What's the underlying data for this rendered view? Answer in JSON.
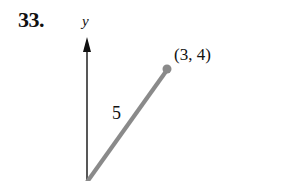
{
  "problem": {
    "number": "33."
  },
  "axes": {
    "y_label": "y"
  },
  "point": {
    "label": "(3, 4)",
    "x": 3,
    "y": 4
  },
  "segment": {
    "length_label": "5",
    "from": [
      0,
      0
    ],
    "to": [
      3,
      4
    ]
  },
  "colors": {
    "text": "#111111",
    "axis": "#111111",
    "segment": "#8a8a8a",
    "point": "#8a8a8a"
  }
}
